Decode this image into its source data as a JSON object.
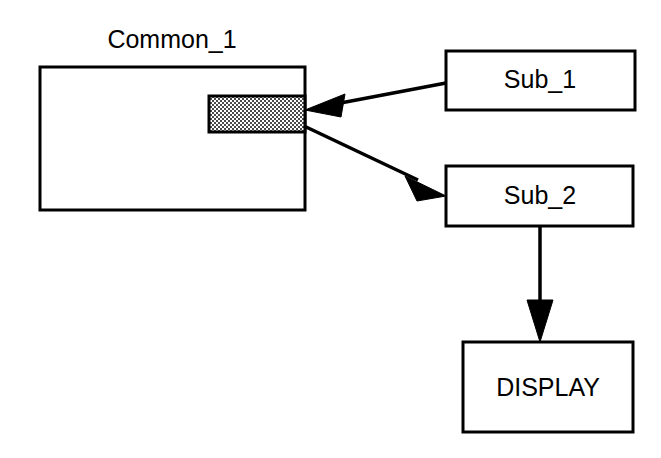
{
  "diagram": {
    "type": "block-flow-diagram",
    "background_color": "#ffffff",
    "stroke_color": "#000000",
    "shaded_fill_color": "#a8a8a8",
    "title": "Common_1",
    "nodes": [
      {
        "id": "common_1",
        "label": "Common_1",
        "label_position": "above-box",
        "shape": "rectangle",
        "fill": "#ffffff",
        "x": 40,
        "y": 67,
        "width": 265,
        "height": 143
      },
      {
        "id": "shaded_block",
        "label": "",
        "shape": "rectangle",
        "fill": "#a8a8a8",
        "pattern": "halftone-checker",
        "x": 209,
        "y": 96,
        "width": 96,
        "height": 36
      },
      {
        "id": "sub_1",
        "label": "Sub_1",
        "shape": "rectangle",
        "fill": "#ffffff",
        "x": 446,
        "y": 51,
        "width": 189,
        "height": 59
      },
      {
        "id": "sub_2",
        "label": "Sub_2",
        "shape": "rectangle",
        "fill": "#ffffff",
        "x": 446,
        "y": 166,
        "width": 187,
        "height": 60
      },
      {
        "id": "display",
        "label": "DISPLAY",
        "shape": "rectangle",
        "fill": "#ffffff",
        "x": 463,
        "y": 342,
        "width": 170,
        "height": 90
      }
    ],
    "edges": [
      {
        "id": "edge-sub1-to-common",
        "from": "sub_1",
        "to": "shaded_block",
        "arrowhead": "end",
        "direction": "left"
      },
      {
        "id": "edge-common-to-sub2",
        "from": "shaded_block",
        "to": "sub_2",
        "arrowhead": "end",
        "direction": "down-right"
      },
      {
        "id": "edge-sub2-to-display",
        "from": "sub_2",
        "to": "display",
        "arrowhead": "end",
        "direction": "down"
      }
    ]
  }
}
